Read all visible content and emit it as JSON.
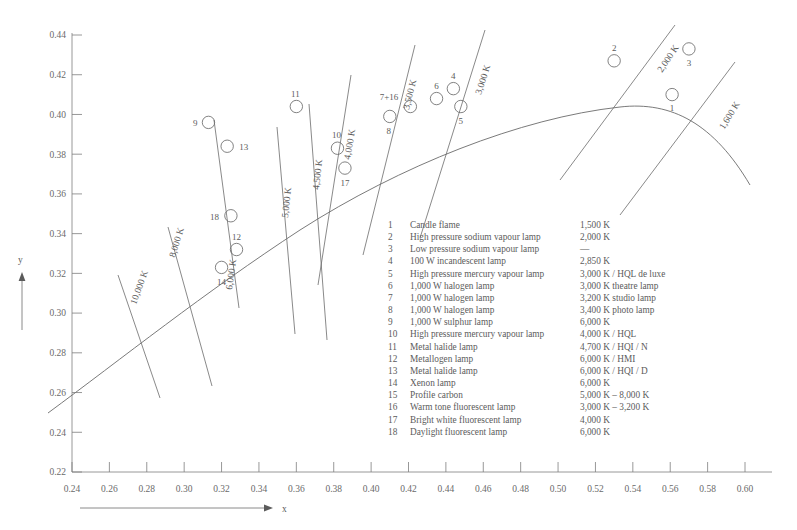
{
  "chart_data": {
    "type": "scatter",
    "title": "",
    "xlabel": "x",
    "ylabel": "y",
    "xlim": [
      0.23,
      0.612
    ],
    "ylim": [
      0.22,
      0.452
    ],
    "grid": false,
    "legend_position": "inside-center",
    "x_ticks": [
      "0.24",
      "0.26",
      "0.28",
      "0.30",
      "0.32",
      "0.34",
      "0.36",
      "0.38",
      "0.40",
      "0.42",
      "0.44",
      "0.46",
      "0.48",
      "0.50",
      "0.52",
      "0.54",
      "0.56",
      "0.58",
      "0.60"
    ],
    "y_ticks": [
      "0.22",
      "0.24",
      "0.26",
      "0.28",
      "0.30",
      "0.32",
      "0.34",
      "0.36",
      "0.38",
      "0.40",
      "0.42",
      "0.44"
    ],
    "annotations": {
      "planckian_locus": "black body curve",
      "isotherm_lines": 12
    },
    "points": [
      {
        "id": "1",
        "x": 0.561,
        "y": 0.41
      },
      {
        "id": "2",
        "x": 0.53,
        "y": 0.427
      },
      {
        "id": "3",
        "x": 0.57,
        "y": 0.433
      },
      {
        "id": "4",
        "x": 0.444,
        "y": 0.413
      },
      {
        "id": "5",
        "x": 0.448,
        "y": 0.404
      },
      {
        "id": "6",
        "x": 0.435,
        "y": 0.408
      },
      {
        "id": "7+16",
        "x": 0.421,
        "y": 0.404
      },
      {
        "id": "8",
        "x": 0.41,
        "y": 0.399
      },
      {
        "id": "9",
        "x": 0.313,
        "y": 0.396
      },
      {
        "id": "10",
        "x": 0.382,
        "y": 0.383
      },
      {
        "id": "11",
        "x": 0.36,
        "y": 0.404
      },
      {
        "id": "12",
        "x": 0.328,
        "y": 0.332
      },
      {
        "id": "13",
        "x": 0.323,
        "y": 0.384
      },
      {
        "id": "14",
        "x": 0.32,
        "y": 0.323
      },
      {
        "id": "17",
        "x": 0.386,
        "y": 0.373
      },
      {
        "id": "18",
        "x": 0.325,
        "y": 0.349
      }
    ],
    "isotherms": [
      {
        "label": "10,000 K"
      },
      {
        "label": "8,000 K"
      },
      {
        "label": "6,000 K"
      },
      {
        "label": "5,000 K"
      },
      {
        "label": "4,500 K"
      },
      {
        "label": "4,000 K"
      },
      {
        "label": "3,500 K"
      },
      {
        "label": "3,000 K"
      },
      {
        "label": "2,000 K"
      },
      {
        "label": "1,600 K"
      }
    ]
  },
  "legend": {
    "rows": [
      {
        "num": "1",
        "name": "Candle flame",
        "temp": "1,500 K"
      },
      {
        "num": "2",
        "name": "High pressure sodium vapour lamp",
        "temp": "2,000 K"
      },
      {
        "num": "3",
        "name": "Low pressure sodium vapour lamp",
        "temp": "—"
      },
      {
        "num": "4",
        "name": "100 W incandescent lamp",
        "temp": "2,850 K"
      },
      {
        "num": "5",
        "name": "High pressure mercury vapour lamp",
        "temp": "3,000 K / HQL de luxe"
      },
      {
        "num": "6",
        "name": "1,000 W halogen lamp",
        "temp": "3,000 K theatre lamp"
      },
      {
        "num": "7",
        "name": "1,000 W halogen lamp",
        "temp": "3,200 K studio lamp"
      },
      {
        "num": "8",
        "name": "1,000 W halogen lamp",
        "temp": "3,400 K photo lamp"
      },
      {
        "num": "9",
        "name": "1,000 W sulphur lamp",
        "temp": "6,000 K"
      },
      {
        "num": "10",
        "name": "High pressure mercury vapour lamp",
        "temp": "4,000 K / HQL"
      },
      {
        "num": "11",
        "name": "Metal halide lamp",
        "temp": "4,700 K / HQI / N"
      },
      {
        "num": "12",
        "name": "Metallogen lamp",
        "temp": "6,000 K / HMI"
      },
      {
        "num": "13",
        "name": "Metal halide lamp",
        "temp": "6,000 K / HQI / D"
      },
      {
        "num": "14",
        "name": "Xenon lamp",
        "temp": "6,000 K"
      },
      {
        "num": "15",
        "name": "Profile carbon",
        "temp": "5,000 K – 8,000 K"
      },
      {
        "num": "16",
        "name": "Warm tone fluorescent lamp",
        "temp": "3,000 K – 3,200 K"
      },
      {
        "num": "17",
        "name": "Bright white fluorescent lamp",
        "temp": "4,000 K"
      },
      {
        "num": "18",
        "name": "Daylight fluorescent lamp",
        "temp": "6,000 K"
      }
    ]
  },
  "axes": {
    "x_name": "x",
    "y_name": "y"
  },
  "colors": {
    "line": "#6b6b6b",
    "text": "#5b5b5b",
    "background": "#ffffff"
  }
}
